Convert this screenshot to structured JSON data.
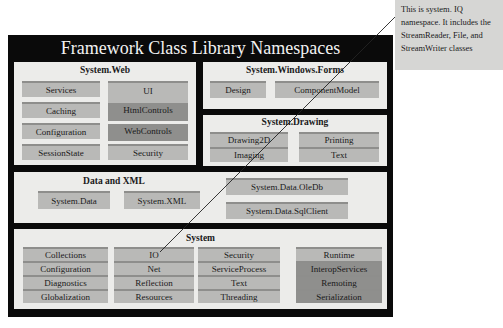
{
  "title": "Framework Class Library Namespaces",
  "callout": {
    "text": "This is system. IQ namespace. It includes the StreamReader, File, and StreamWriter classes"
  },
  "panels": {
    "web": {
      "title": "System.Web",
      "left": [
        "Services",
        "Caching",
        "Configuration",
        "SessionState"
      ],
      "right": [
        "UI",
        "HtmlControls",
        "WebControls",
        "Security"
      ]
    },
    "forms": {
      "title": "System.Windows.Forms",
      "items": [
        "Design",
        "ComponentModel"
      ]
    },
    "drawing": {
      "title": "System.Drawing",
      "items": [
        "Drawing2D",
        "Printing",
        "Imaging",
        "Text"
      ]
    },
    "data": {
      "title": "Data and XML",
      "items": [
        "System.Data",
        "System.XML",
        "System.Data.OleDb",
        "System.Data.SqlClient"
      ]
    },
    "system": {
      "title": "System",
      "col1": [
        "Collections",
        "Configuration",
        "Diagnostics",
        "Globalization"
      ],
      "col2": [
        "IO",
        "Net",
        "Reflection",
        "Resources"
      ],
      "col3": [
        "Security",
        "ServiceProcess",
        "Text",
        "Threading"
      ],
      "col4": [
        "Runtime",
        "InteropServices",
        "Remoting",
        "Serialization"
      ]
    }
  }
}
